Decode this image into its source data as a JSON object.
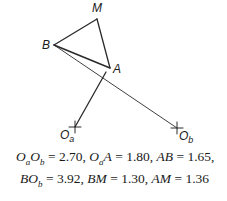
{
  "diagram": {
    "points": {
      "M": {
        "label": "M",
        "x": 97,
        "y": 19
      },
      "B": {
        "label": "B",
        "x": 54,
        "y": 45
      },
      "A": {
        "label": "A",
        "x": 110,
        "y": 68
      },
      "Oa": {
        "label": "O",
        "sub": "a",
        "x": 75,
        "y": 127
      },
      "Ob": {
        "label": "O",
        "sub": "b",
        "x": 177,
        "y": 128
      }
    },
    "segments": [
      [
        "B",
        "M"
      ],
      [
        "M",
        "A"
      ],
      [
        "B",
        "A"
      ],
      [
        "A",
        "Oa"
      ],
      [
        "B",
        "Ob"
      ]
    ],
    "equations": {
      "line1": {
        "OaOb": {
          "lhs_o1": "O",
          "lhs_s1": "a",
          "lhs_o2": "O",
          "lhs_s2": "b",
          "value": "2.70"
        },
        "OaA": {
          "lhs_o": "O",
          "lhs_s": "a",
          "lhs_p": "A",
          "value": "1.80"
        },
        "AB": {
          "lhs": "AB",
          "value": "1.65"
        }
      },
      "line2": {
        "BOb": {
          "lhs_b": "B",
          "lhs_o": "O",
          "lhs_s": "b",
          "value": "3.92"
        },
        "BM": {
          "lhs": "BM",
          "value": "1.30"
        },
        "AM": {
          "lhs": "AM",
          "value": "1.36"
        }
      }
    }
  }
}
